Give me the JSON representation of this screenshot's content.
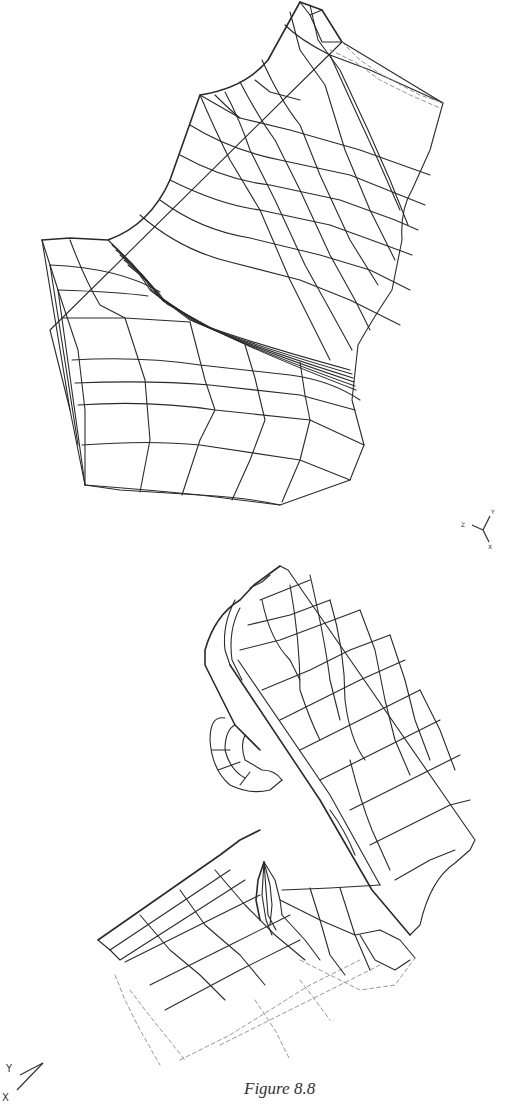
{
  "figure": {
    "caption": "Figure 8.8",
    "top_mesh": {
      "description": "3D finite-element wireframe mesh of a curved solid block with concave fillet",
      "triad_labels": {
        "z": "Z",
        "y": "Y",
        "x": "X"
      }
    },
    "bottom_mesh": {
      "description": "3D finite-element wireframe mesh of an L-shaped bracket with rounded tab and hole",
      "triad_labels": {
        "y": "Y",
        "x": "X"
      }
    },
    "colors": {
      "line": "#2a2a2a",
      "background": "#ffffff"
    }
  }
}
